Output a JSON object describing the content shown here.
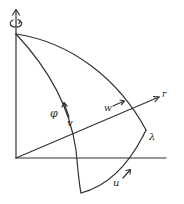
{
  "figure": {
    "type": "geometric diagram",
    "background": "#ffffff",
    "line_color": "#333333",
    "labels": {
      "phi": "φ",
      "v": "v",
      "w": "w",
      "r": "r",
      "lambda": "λ",
      "u": "u"
    },
    "icons": {
      "rotation": "rotation-arrow-icon"
    }
  }
}
